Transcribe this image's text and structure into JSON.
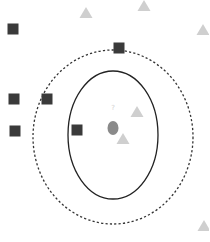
{
  "diagram": {
    "title": "",
    "query_label": "?",
    "colors": {
      "square": "#3a3a3a",
      "triangle": "#cfcfcf",
      "query": "#8a8a8a",
      "inner_boundary": "#222222",
      "outer_boundary": "#333333",
      "background": "#ffffff"
    },
    "query_point": {
      "cx": 113,
      "cy": 128,
      "rx": 5.5,
      "ry": 7
    },
    "inner_circle": {
      "cx": 113,
      "cy": 135,
      "rx": 45,
      "ry": 64,
      "style": "solid"
    },
    "outer_circle": {
      "cx": 113,
      "cy": 137,
      "rx": 80,
      "ry": 87,
      "style": "dashed"
    },
    "squares": [
      {
        "x": 13,
        "y": 29
      },
      {
        "x": 119,
        "y": 48
      },
      {
        "x": 14,
        "y": 99
      },
      {
        "x": 47,
        "y": 99
      },
      {
        "x": 15,
        "y": 131
      },
      {
        "x": 77,
        "y": 130
      }
    ],
    "triangles": [
      {
        "x": 86,
        "y": 13
      },
      {
        "x": 144,
        "y": 6
      },
      {
        "x": 203,
        "y": 30
      },
      {
        "x": 137,
        "y": 112
      },
      {
        "x": 123,
        "y": 139
      },
      {
        "x": 204,
        "y": 226
      }
    ]
  }
}
